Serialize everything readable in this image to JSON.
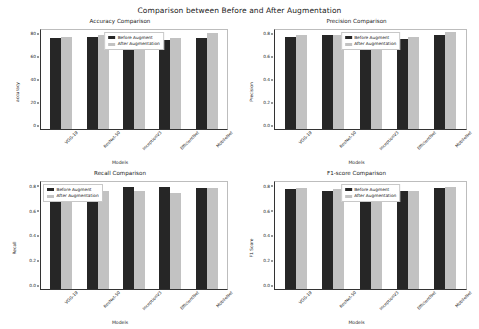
{
  "figure": {
    "suptitle": "Comparison between Before and After Augmentation",
    "xlabel": "Models",
    "legend": {
      "before_label": "Before Augment",
      "after_label": "After Augmentation",
      "before_color": "#262626",
      "after_color": "#c2c2c2"
    }
  },
  "chart_data": [
    {
      "type": "bar",
      "title": "Accuracy Comparison",
      "xlabel": "Models",
      "ylabel": "accuracy",
      "categories": [
        "VGG-19",
        "ResNet-50",
        "InceptionV3",
        "EfficientNet",
        "MobileNet"
      ],
      "ylim": [
        0,
        88
      ],
      "yticks": [
        0,
        20,
        40,
        60,
        80
      ],
      "ytick_labels": [
        "0",
        "20",
        "40",
        "60",
        "80"
      ],
      "grid": false,
      "legend_position": "upper center",
      "series": [
        {
          "name": "Before Augment",
          "values": [
            81,
            82,
            76,
            79,
            81
          ]
        },
        {
          "name": "After Augmentation",
          "values": [
            82,
            84,
            80,
            81,
            85
          ]
        }
      ]
    },
    {
      "type": "bar",
      "title": "Precision Comparison",
      "xlabel": "Models",
      "ylabel": "Precision",
      "categories": [
        "VGG-19",
        "ResNet-50",
        "InceptionV3",
        "EfficientNet",
        "MobileNet"
      ],
      "ylim": [
        0,
        0.88
      ],
      "yticks": [
        0.0,
        0.2,
        0.4,
        0.6,
        0.8
      ],
      "ytick_labels": [
        "0.0",
        "0.2",
        "0.4",
        "0.6",
        "0.8"
      ],
      "grid": false,
      "legend_position": "upper center",
      "series": [
        {
          "name": "Before Augment",
          "values": [
            0.82,
            0.84,
            0.76,
            0.8,
            0.84
          ]
        },
        {
          "name": "After Augmentation",
          "values": [
            0.84,
            0.84,
            0.77,
            0.82,
            0.86
          ]
        }
      ]
    },
    {
      "type": "bar",
      "title": "Recall Comparison",
      "xlabel": "Models",
      "ylabel": "Recall",
      "categories": [
        "VGG-19",
        "ResNet-50",
        "InceptionV3",
        "EfficientNet",
        "MobileNet"
      ],
      "ylim": [
        0,
        0.88
      ],
      "yticks": [
        0.0,
        0.2,
        0.4,
        0.6,
        0.8
      ],
      "ytick_labels": [
        "0.0",
        "0.2",
        "0.4",
        "0.6",
        "0.8"
      ],
      "grid": false,
      "legend_position": "upper left",
      "series": [
        {
          "name": "Before Augment",
          "values": [
            0.82,
            0.79,
            0.84,
            0.84,
            0.83
          ]
        },
        {
          "name": "After Augmentation",
          "values": [
            0.82,
            0.81,
            0.81,
            0.79,
            0.83
          ]
        }
      ]
    },
    {
      "type": "bar",
      "title": "F1-score Comparison",
      "xlabel": "Models",
      "ylabel": "F1 Score",
      "categories": [
        "VGG-19",
        "ResNet-50",
        "InceptionV3",
        "EfficientNet",
        "MobileNet"
      ],
      "ylim": [
        0,
        0.88
      ],
      "yticks": [
        0.0,
        0.2,
        0.4,
        0.6,
        0.8
      ],
      "ytick_labels": [
        "0.0",
        "0.2",
        "0.4",
        "0.6",
        "0.8"
      ],
      "grid": false,
      "legend_position": "upper center",
      "series": [
        {
          "name": "Before Augment",
          "values": [
            0.82,
            0.81,
            0.79,
            0.81,
            0.83
          ]
        },
        {
          "name": "After Augmentation",
          "values": [
            0.83,
            0.82,
            0.8,
            0.81,
            0.84
          ]
        }
      ]
    }
  ]
}
